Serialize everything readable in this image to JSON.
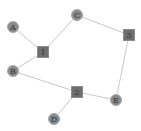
{
  "diagram": {
    "type": "bipartite-graph",
    "nodes": [
      {
        "id": "A",
        "label": "A",
        "shape": "circle",
        "x": 13,
        "y": 27
      },
      {
        "id": "B",
        "label": "B",
        "shape": "circle",
        "x": 13,
        "y": 71
      },
      {
        "id": "C",
        "label": "C",
        "shape": "circle",
        "x": 77,
        "y": 15
      },
      {
        "id": "D",
        "label": "D",
        "shape": "circle",
        "x": 54,
        "y": 119
      },
      {
        "id": "E",
        "label": "E",
        "shape": "circle",
        "x": 116,
        "y": 100
      },
      {
        "id": "1",
        "label": "1",
        "shape": "square",
        "x": 43,
        "y": 52
      },
      {
        "id": "2",
        "label": "2",
        "shape": "square",
        "x": 77,
        "y": 92
      },
      {
        "id": "3",
        "label": "3",
        "shape": "square",
        "x": 129,
        "y": 35
      }
    ],
    "edges": [
      {
        "from": "A",
        "to": "1"
      },
      {
        "from": "B",
        "to": "1"
      },
      {
        "from": "C",
        "to": "1"
      },
      {
        "from": "C",
        "to": "3"
      },
      {
        "from": "3",
        "to": "E"
      },
      {
        "from": "B",
        "to": "2"
      },
      {
        "from": "D",
        "to": "2"
      },
      {
        "from": "2",
        "to": "E"
      }
    ],
    "colors": {
      "edge": "#c8c8c8",
      "circle_fill": "#8a8a8a",
      "square_fill": "#6e6e6e",
      "label": "#333333"
    }
  }
}
